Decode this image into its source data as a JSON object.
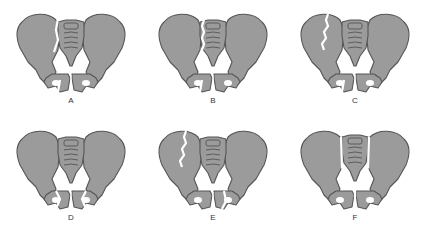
{
  "figure": {
    "colors": {
      "bone": "#9b9b9b",
      "outline": "#555555",
      "background": "#ffffff"
    },
    "panels": [
      {
        "label": "A",
        "fracture": "vertical fracture through left ilium/sacroiliac region and pubic ramus"
      },
      {
        "label": "B",
        "fracture": "fracture through sacrum beside sacroiliac joint with pubic ramus fracture"
      },
      {
        "label": "C",
        "fracture": "jagged fracture through left ilium with pubic ramus fracture"
      },
      {
        "label": "D",
        "fracture": "bilateral pubic rami fractures (butterfly segment)"
      },
      {
        "label": "E",
        "fracture": "jagged iliac fracture with contralateral pubic ramus fracture"
      },
      {
        "label": "F",
        "fracture": "bilateral sacroiliac and symphysis disruption (sacrum separated)"
      }
    ]
  }
}
